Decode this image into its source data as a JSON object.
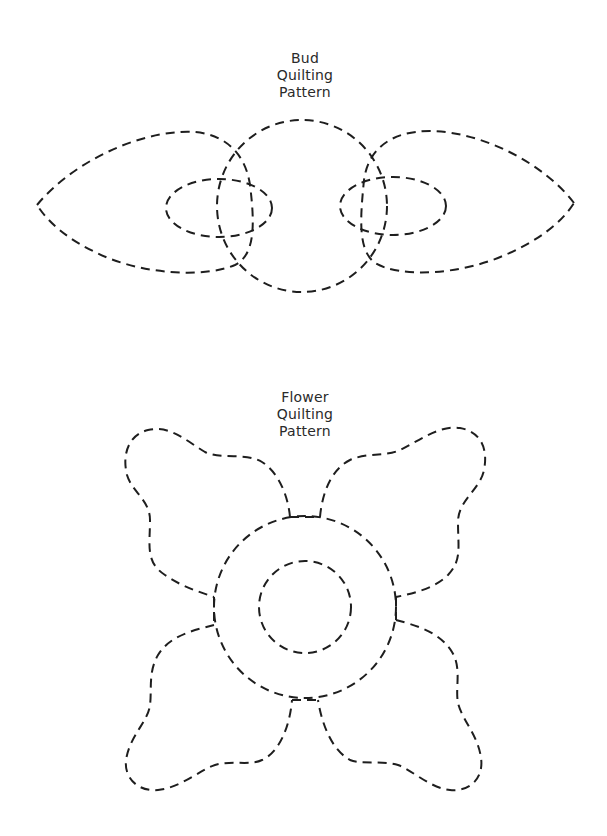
{
  "figures": [
    {
      "id": "bud",
      "title_lines": [
        "Bud",
        "Quilting",
        "Pattern"
      ]
    },
    {
      "id": "flower",
      "title_lines": [
        "Flower",
        "Quilting",
        "Pattern"
      ]
    }
  ],
  "style": {
    "line_color": "#1e1e1e",
    "text_color": "#2a2a2a",
    "background": "#ffffff",
    "line_style": "dashed"
  }
}
